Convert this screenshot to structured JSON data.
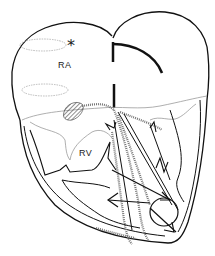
{
  "figure": {
    "type": "heart-anatomy-line-drawing",
    "labels": {
      "right_atrium": "RA",
      "right_ventricle": "RV",
      "marker": "*"
    },
    "colors": {
      "outline": "#111111",
      "thin_line": "#9a9a9a",
      "hatched": "#555555",
      "background": "#ffffff"
    }
  }
}
